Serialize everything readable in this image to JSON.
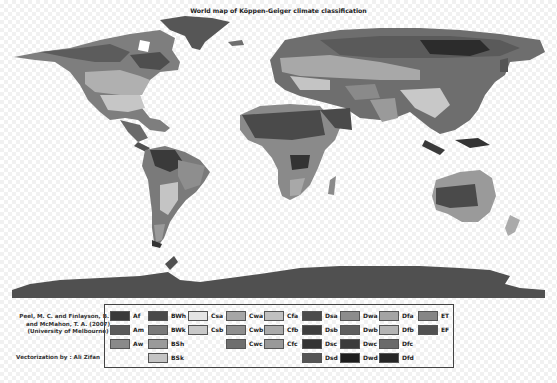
{
  "title": "World map of Köppen-Geiger climate classification",
  "credits": {
    "line1": "Peel, M. C. and Finlayson, B. L.",
    "line2": "and McMahon, T. A. (2007)",
    "line3": "(University of Melbourne)",
    "vectorization": "Vectorization by : Ali Zifan"
  },
  "legend": {
    "items": [
      {
        "code": "Af",
        "color": "#3a3a3a",
        "col": 0,
        "row": 0
      },
      {
        "code": "Am",
        "color": "#5a5a5a",
        "col": 0,
        "row": 1
      },
      {
        "code": "Aw",
        "color": "#8a8a8a",
        "col": 0,
        "row": 2
      },
      {
        "code": "BWh",
        "color": "#4a4a4a",
        "col": 1,
        "row": 0
      },
      {
        "code": "BWk",
        "color": "#7a7a7a",
        "col": 1,
        "row": 1
      },
      {
        "code": "BSh",
        "color": "#9a9a9a",
        "col": 1,
        "row": 2
      },
      {
        "code": "BSk",
        "color": "#c4c4c4",
        "col": 1,
        "row": 3
      },
      {
        "code": "Csa",
        "color": "#e4e4e4",
        "col": 2,
        "row": 0
      },
      {
        "code": "Csb",
        "color": "#c8c8c8",
        "col": 2,
        "row": 1
      },
      {
        "code": "Cwa",
        "color": "#a6a6a6",
        "col": 3,
        "row": 0
      },
      {
        "code": "Cwb",
        "color": "#8e8e8e",
        "col": 3,
        "row": 1
      },
      {
        "code": "Cwc",
        "color": "#6e6e6e",
        "col": 3,
        "row": 2
      },
      {
        "code": "Cfa",
        "color": "#c0c0c0",
        "col": 4,
        "row": 0
      },
      {
        "code": "Cfb",
        "color": "#aaaaaa",
        "col": 4,
        "row": 1
      },
      {
        "code": "Cfc",
        "color": "#999999",
        "col": 4,
        "row": 2
      },
      {
        "code": "Dsa",
        "color": "#4c4c4c",
        "col": 5,
        "row": 0
      },
      {
        "code": "Dsb",
        "color": "#3e3e3e",
        "col": 5,
        "row": 1
      },
      {
        "code": "Dsc",
        "color": "#333333",
        "col": 5,
        "row": 2
      },
      {
        "code": "Dsd",
        "color": "#555555",
        "col": 5,
        "row": 3
      },
      {
        "code": "Dwa",
        "color": "#8c8c8c",
        "col": 6,
        "row": 0
      },
      {
        "code": "Dwb",
        "color": "#5e5e5e",
        "col": 6,
        "row": 1
      },
      {
        "code": "Dwc",
        "color": "#3c3c3c",
        "col": 6,
        "row": 2
      },
      {
        "code": "Dwd",
        "color": "#1e1e1e",
        "col": 6,
        "row": 3
      },
      {
        "code": "Dfa",
        "color": "#a4a4a4",
        "col": 7,
        "row": 0
      },
      {
        "code": "Dfb",
        "color": "#b4b4b4",
        "col": 7,
        "row": 1
      },
      {
        "code": "Dfc",
        "color": "#6a6a6a",
        "col": 7,
        "row": 2
      },
      {
        "code": "Dfd",
        "color": "#262626",
        "col": 7,
        "row": 3
      },
      {
        "code": "ET",
        "color": "#868686",
        "col": 8,
        "row": 0
      },
      {
        "code": "EF",
        "color": "#505050",
        "col": 8,
        "row": 1
      }
    ]
  },
  "map": {
    "regions": [
      {
        "name": "north-america",
        "label": ""
      },
      {
        "name": "greenland",
        "label": ""
      },
      {
        "name": "south-america",
        "label": ""
      },
      {
        "name": "europe-asia",
        "label": ""
      },
      {
        "name": "africa",
        "label": ""
      },
      {
        "name": "australia",
        "label": ""
      },
      {
        "name": "antarctica",
        "label": ""
      }
    ]
  }
}
